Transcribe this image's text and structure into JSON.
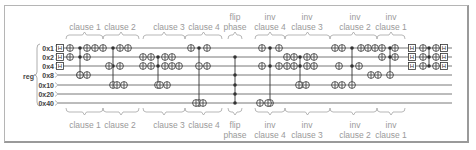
{
  "register": {
    "name": "reg",
    "qubits": [
      "0x1",
      "0x2",
      "0x4",
      "0x8",
      "0x10",
      "0x20",
      "0x40"
    ]
  },
  "colors": {
    "wire": "#555555",
    "gate": "#333333",
    "label": "#9a9a9a",
    "frame": "#b5b5b5"
  },
  "top_labels": [
    {
      "id": "clause1",
      "lines": [
        "clause 1"
      ],
      "x": 85
    },
    {
      "id": "clause2",
      "lines": [
        "clause 2"
      ],
      "x": 120
    },
    {
      "id": "clause3",
      "lines": [
        "clause 3"
      ],
      "x": 169
    },
    {
      "id": "clause4",
      "lines": [
        "clause 4"
      ],
      "x": 204
    },
    {
      "id": "flip",
      "lines": [
        "flip",
        "phase"
      ],
      "x": 235
    },
    {
      "id": "inv4",
      "lines": [
        "inv",
        "clause 4"
      ],
      "x": 270
    },
    {
      "id": "inv3",
      "lines": [
        "inv",
        "clause 3"
      ],
      "x": 307
    },
    {
      "id": "inv2",
      "lines": [
        "inv",
        "clause 2"
      ],
      "x": 355
    },
    {
      "id": "inv1",
      "lines": [
        "inv",
        "clause 1"
      ],
      "x": 391
    }
  ],
  "bottom_labels": [
    {
      "id": "clause1",
      "lines": [
        "clause 1"
      ],
      "x": 85
    },
    {
      "id": "clause2",
      "lines": [
        "clause 2"
      ],
      "x": 120
    },
    {
      "id": "clause3",
      "lines": [
        "clause 3"
      ],
      "x": 169
    },
    {
      "id": "clause4",
      "lines": [
        "clause 4"
      ],
      "x": 204
    },
    {
      "id": "flip",
      "lines": [
        "flip",
        "phase"
      ],
      "x": 235
    },
    {
      "id": "inv4",
      "lines": [
        "inv",
        "clause 4"
      ],
      "x": 270
    },
    {
      "id": "inv3",
      "lines": [
        "inv",
        "clause 3"
      ],
      "x": 307
    },
    {
      "id": "inv2",
      "lines": [
        "inv",
        "clause 2"
      ],
      "x": 355
    },
    {
      "id": "inv1",
      "lines": [
        "inv",
        "clause 1"
      ],
      "x": 391
    }
  ],
  "braces": [
    {
      "x1": 66,
      "x2": 103
    },
    {
      "x1": 103,
      "x2": 139
    },
    {
      "x1": 143,
      "x2": 185
    },
    {
      "x1": 185,
      "x2": 222
    },
    {
      "x1": 228,
      "x2": 242
    },
    {
      "x1": 255,
      "x2": 285
    },
    {
      "x1": 285,
      "x2": 330
    },
    {
      "x1": 330,
      "x2": 377
    },
    {
      "x1": 377,
      "x2": 405
    }
  ],
  "hadamard_label": "H",
  "gates": {
    "h_columns": [
      {
        "x": 60,
        "rows": [
          0,
          1,
          2
        ]
      },
      {
        "x": 412,
        "rows": [
          0,
          1,
          2
        ]
      },
      {
        "x": 444,
        "rows": [
          0,
          1,
          2
        ]
      }
    ],
    "x_gates": [
      [
        70,
        0
      ],
      [
        70,
        1
      ],
      [
        87,
        0
      ],
      [
        87,
        1
      ],
      [
        80,
        3
      ],
      [
        87,
        3
      ],
      [
        95,
        0
      ],
      [
        103,
        0
      ],
      [
        109,
        2
      ],
      [
        120,
        0
      ],
      [
        128,
        0
      ],
      [
        120,
        2
      ],
      [
        117,
        4
      ],
      [
        124,
        4
      ],
      [
        143,
        1
      ],
      [
        151,
        1
      ],
      [
        143,
        2
      ],
      [
        151,
        2
      ],
      [
        165,
        1
      ],
      [
        172,
        1
      ],
      [
        165,
        2
      ],
      [
        172,
        2
      ],
      [
        179,
        2
      ],
      [
        160,
        4
      ],
      [
        167,
        4
      ],
      [
        191,
        0
      ],
      [
        207,
        0
      ],
      [
        207,
        2
      ],
      [
        199,
        2
      ],
      [
        196,
        6
      ],
      [
        203,
        6
      ],
      [
        262,
        0
      ],
      [
        279,
        0
      ],
      [
        262,
        2
      ],
      [
        279,
        2
      ],
      [
        287,
        1
      ],
      [
        294,
        1
      ],
      [
        287,
        2
      ],
      [
        294,
        2
      ],
      [
        260,
        6
      ],
      [
        268,
        6
      ],
      [
        307,
        1
      ],
      [
        314,
        1
      ],
      [
        307,
        2
      ],
      [
        314,
        2
      ],
      [
        299,
        4
      ],
      [
        306,
        4
      ],
      [
        335,
        0
      ],
      [
        342,
        0
      ],
      [
        361,
        0
      ],
      [
        368,
        0
      ],
      [
        375,
        0
      ],
      [
        382,
        0
      ],
      [
        339,
        2
      ],
      [
        359,
        2
      ],
      [
        335,
        4
      ],
      [
        342,
        4
      ],
      [
        382,
        1
      ],
      [
        371,
        3
      ],
      [
        378,
        3
      ],
      [
        395,
        0
      ],
      [
        395,
        1
      ],
      [
        423,
        0
      ],
      [
        423,
        1
      ],
      [
        423,
        2
      ],
      [
        436,
        0
      ],
      [
        436,
        1
      ],
      [
        436,
        2
      ]
    ],
    "controls": [
      {
        "x": 80,
        "rows": [
          0,
          1
        ],
        "to": 3
      },
      {
        "x": 113,
        "rows": [
          0,
          2
        ],
        "to": 4
      },
      {
        "x": 158,
        "rows": [
          1,
          2
        ],
        "to": 4
      },
      {
        "x": 199,
        "rows": [
          0,
          2
        ],
        "to": 6
      },
      {
        "x": 235,
        "rows": [
          1,
          3,
          4,
          5,
          6
        ],
        "to": null
      },
      {
        "x": 270,
        "rows": [
          0,
          2
        ],
        "to": 6
      },
      {
        "x": 300,
        "rows": [
          1,
          2
        ],
        "to": 4
      },
      {
        "x": 352,
        "rows": [
          0,
          2
        ],
        "to": 4
      },
      {
        "x": 390,
        "rows": [
          0,
          1
        ],
        "to": 3
      },
      {
        "x": 429,
        "rows": [
          0,
          1,
          2
        ],
        "to": null
      }
    ]
  }
}
